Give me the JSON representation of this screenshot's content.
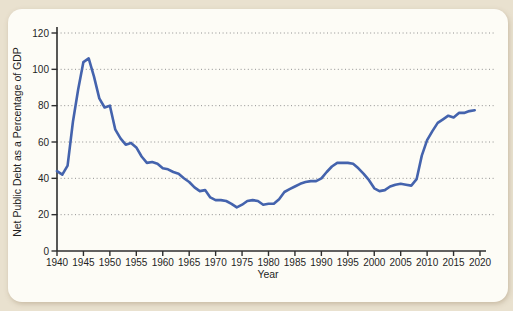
{
  "page": {
    "background": "#e9e1cf"
  },
  "card": {
    "background": "#fdfcf6"
  },
  "chart_data": {
    "type": "line",
    "title": "",
    "xlabel": "Year",
    "ylabel": "Net Public Debt as a Percentage of GDP",
    "xlim": [
      1940,
      2020
    ],
    "ylim": [
      0,
      120
    ],
    "x_ticks": [
      1940,
      1945,
      1950,
      1955,
      1960,
      1965,
      1970,
      1975,
      1980,
      1985,
      1990,
      1995,
      2000,
      2005,
      2010,
      2015,
      2020
    ],
    "y_ticks": [
      0,
      20,
      40,
      60,
      80,
      100,
      120
    ],
    "grid": "horizontal dotted",
    "legend_position": "none",
    "colors": {
      "line": "#4463ad",
      "gridline": "#909090",
      "axis": "#2e2e2e",
      "tick_text": "#1f1f1f"
    },
    "series": [
      {
        "name": "Net public debt as a percentage of GDP",
        "color": "#4463ad",
        "x": [
          1940,
          1941,
          1942,
          1943,
          1944,
          1945,
          1946,
          1947,
          1948,
          1949,
          1950,
          1951,
          1952,
          1953,
          1954,
          1955,
          1956,
          1957,
          1958,
          1959,
          1960,
          1961,
          1962,
          1963,
          1964,
          1965,
          1966,
          1967,
          1968,
          1969,
          1970,
          1971,
          1972,
          1973,
          1974,
          1975,
          1976,
          1977,
          1978,
          1979,
          1980,
          1981,
          1982,
          1983,
          1984,
          1985,
          1986,
          1987,
          1988,
          1989,
          1990,
          1991,
          1992,
          1993,
          1994,
          1995,
          1996,
          1997,
          1998,
          1999,
          2000,
          2001,
          2002,
          2003,
          2004,
          2005,
          2006,
          2007,
          2008,
          2009,
          2010,
          2011,
          2012,
          2013,
          2014,
          2015,
          2016,
          2017,
          2018,
          2019
        ],
        "values": [
          44,
          42,
          47,
          71,
          89,
          104,
          106,
          96,
          84,
          79,
          80,
          67,
          62,
          58.5,
          59.5,
          57,
          52,
          48.5,
          49,
          48,
          45.5,
          45,
          43.5,
          42.5,
          40,
          38,
          35,
          33,
          33.5,
          29.5,
          28,
          28,
          27.5,
          26,
          24,
          25.5,
          27.5,
          28,
          27.5,
          25.5,
          26,
          26,
          28.5,
          32.5,
          34,
          35.5,
          37,
          38,
          38.5,
          38.5,
          40,
          43.5,
          46.5,
          48.5,
          48.5,
          48.5,
          48,
          45.5,
          42.5,
          39,
          34.5,
          33,
          33.5,
          35.5,
          36.5,
          37,
          36.5,
          36,
          39.5,
          52.5,
          61,
          66,
          70.5,
          72.5,
          74.5,
          73.5,
          76,
          76,
          77,
          77.5
        ]
      }
    ]
  }
}
